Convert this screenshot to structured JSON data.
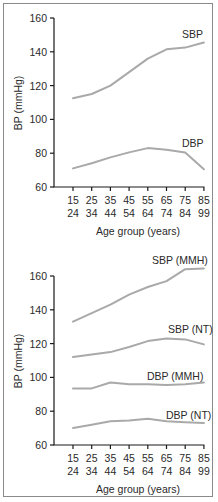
{
  "chart_data": [
    {
      "type": "line",
      "title": "",
      "xlabel": "Age group (years)",
      "ylabel": "BP (mmHg)",
      "ylim": [
        60,
        160
      ],
      "yticks": [
        60,
        80,
        100,
        120,
        140,
        160
      ],
      "grid": false,
      "legend": "inline labels",
      "categories": [
        "15-24",
        "25-34",
        "35-44",
        "45-54",
        "55-64",
        "65-74",
        "75-84",
        "85-99"
      ],
      "tick_top": [
        "15",
        "25",
        "35",
        "45",
        "55",
        "65",
        "75",
        "85"
      ],
      "tick_bottom": [
        "24",
        "34",
        "44",
        "54",
        "64",
        "74",
        "84",
        "99"
      ],
      "series": [
        {
          "name": "SBP",
          "values": [
            112.5,
            115,
            120,
            128,
            136,
            141.5,
            142.5,
            145.5
          ]
        },
        {
          "name": "DBP",
          "values": [
            71,
            74,
            77.5,
            80.5,
            83,
            82,
            80.5,
            70.5
          ]
        }
      ]
    },
    {
      "type": "line",
      "title": "",
      "xlabel": "Age group (years)",
      "ylabel": "BP (mmHg)",
      "ylim": [
        60,
        160
      ],
      "yticks": [
        60,
        80,
        100,
        120,
        140,
        160
      ],
      "grid": false,
      "legend": "inline labels",
      "categories": [
        "15-24",
        "25-34",
        "35-44",
        "45-54",
        "55-64",
        "65-74",
        "75-84",
        "85-99"
      ],
      "tick_top": [
        "15",
        "25",
        "35",
        "45",
        "55",
        "65",
        "75",
        "85"
      ],
      "tick_bottom": [
        "24",
        "34",
        "44",
        "54",
        "64",
        "74",
        "84",
        "99"
      ],
      "series": [
        {
          "name": "SBP (MMH)",
          "values": [
            133,
            138,
            143,
            149,
            153.5,
            157,
            164,
            164.5
          ]
        },
        {
          "name": "SBP (NT)",
          "values": [
            112,
            113.5,
            115,
            118,
            121.5,
            123,
            122.5,
            119.5
          ]
        },
        {
          "name": "DBP (MMH)",
          "values": [
            93.5,
            93.5,
            97,
            96,
            96,
            95.5,
            96,
            97
          ]
        },
        {
          "name": "DBP (NT)",
          "values": [
            70,
            72,
            74,
            74.5,
            75.5,
            74,
            73.5,
            73
          ]
        }
      ]
    }
  ],
  "colors": {
    "line": "#a9a9a9",
    "axis": "#1a1a1a",
    "frame": "#8a8a8a"
  },
  "top": {
    "ylabel": "BP (mmHg)",
    "xlabel": "Age group (years)",
    "labels": {
      "sbp": "SBP",
      "dbp": "DBP"
    }
  },
  "bottom": {
    "ylabel": "BP (mmHg)",
    "xlabel": "Age group (years)",
    "labels": {
      "sbp_mmh": "SBP (MMH)",
      "sbp_nt": "SBP (NT)",
      "dbp_mmh": "DBP (MMH)",
      "dbp_nt": "DBP (NT)"
    }
  }
}
